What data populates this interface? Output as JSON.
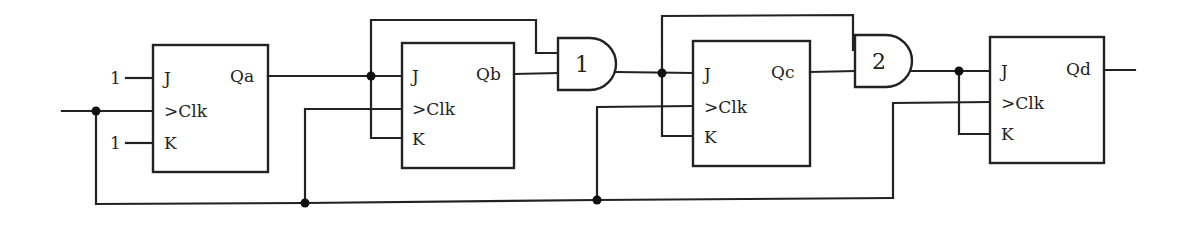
{
  "diagram": {
    "flipflops": [
      {
        "id": "A",
        "j_label": "J",
        "clk_label": ">Clk",
        "k_label": "K",
        "q_label": "Qa",
        "j_input": "1",
        "k_input": "1"
      },
      {
        "id": "B",
        "j_label": "J",
        "clk_label": ">Clk",
        "k_label": "K",
        "q_label": "Qb"
      },
      {
        "id": "C",
        "j_label": "J",
        "clk_label": ">Clk",
        "k_label": "K",
        "q_label": "Qc"
      },
      {
        "id": "D",
        "j_label": "J",
        "clk_label": ">Clk",
        "k_label": "K",
        "q_label": "Qd"
      }
    ],
    "gates": [
      {
        "id": "gate1",
        "type": "AND",
        "label": "1"
      },
      {
        "id": "gate2",
        "type": "AND",
        "label": "2"
      }
    ],
    "colors": {
      "line": "#222222",
      "background": "#ffffff"
    }
  }
}
